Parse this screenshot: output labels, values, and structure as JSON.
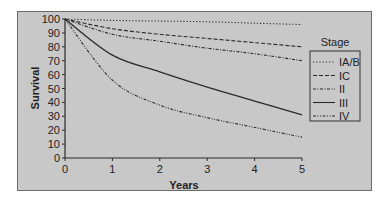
{
  "chart_data": {
    "type": "line",
    "title": "",
    "xlabel": "Years",
    "ylabel": "Survival",
    "xlim": [
      0,
      5
    ],
    "ylim": [
      0,
      100
    ],
    "x": [
      0,
      1,
      2,
      3,
      4,
      5
    ],
    "x_ticks": [
      "0",
      "1",
      "2",
      "3",
      "4",
      "5"
    ],
    "y_ticks": [
      "0",
      "10",
      "20",
      "30",
      "40",
      "50",
      "60",
      "70",
      "80",
      "90",
      "100"
    ],
    "grid": false,
    "legend_title": "Stage",
    "legend_position": "right",
    "series": [
      {
        "name": "IA/B",
        "style": "dotted",
        "values": [
          100,
          99,
          98.5,
          98,
          97,
          96
        ]
      },
      {
        "name": "IC",
        "style": "dashed",
        "values": [
          100,
          93,
          89,
          86,
          83,
          80
        ]
      },
      {
        "name": "II",
        "style": "dash-dot",
        "values": [
          100,
          89,
          84,
          79,
          75,
          70
        ]
      },
      {
        "name": "III",
        "style": "solid",
        "values": [
          100,
          74,
          62,
          51,
          41,
          31
        ]
      },
      {
        "name": "IV",
        "style": "dash-dot-dot",
        "values": [
          100,
          56,
          38,
          29,
          22,
          15
        ]
      }
    ]
  },
  "colors": {
    "panel_background": "#c8c8c8",
    "line": "#2a2a2a",
    "page_background": "#ffffff"
  }
}
